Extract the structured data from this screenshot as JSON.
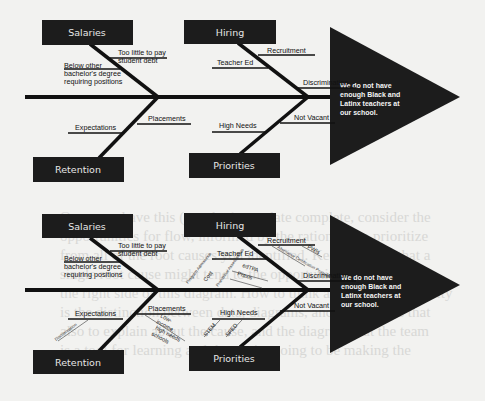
{
  "background_text": [
    "Once you have this (or other) template complete, consider the",
    "opportunities for flow, informed by the rationale, to prioritize",
    "from all of the root causes you identified. Keep in mind that a",
    "single root cause might tend to the opportunities at the heart",
    "the right side of this diagram. How to think about the opportunity",
    "is the distinction between data, diagrams, and the reasons that",
    "also to explain about the cause, and the diagram that the team",
    "is a tool for learning and that we're going to be making the"
  ],
  "diagrams": [
    {
      "id": "fishbone-basic",
      "effect": [
        "We do not have",
        "enough Black and",
        "Latinx teachers at",
        "our school."
      ],
      "categories": {
        "salaries": {
          "label": "Salaries",
          "causes": [
            {
              "label": "Too little to pay",
              "label2": "student debt"
            },
            {
              "label": "Below other",
              "label2": "bachelor's degree",
              "label3": "requiring positions"
            }
          ]
        },
        "hiring": {
          "label": "Hiring",
          "causes": [
            {
              "label": "Recruitment"
            },
            {
              "label": "Teacher Ed"
            },
            {
              "label": "Discrimination"
            }
          ]
        },
        "retention": {
          "label": "Retention",
          "causes": [
            {
              "label": "Placements"
            },
            {
              "label": "Expectations"
            }
          ]
        },
        "priorities": {
          "label": "Priorities",
          "causes": [
            {
              "label": "Not Vacant"
            },
            {
              "label": "High Needs"
            }
          ]
        }
      }
    },
    {
      "id": "fishbone-detailed",
      "effect": [
        "We do not have",
        "enough Black and",
        "Latinx teachers at",
        "our school."
      ],
      "categories": {
        "salaries": {
          "label": "Salaries",
          "causes": [
            {
              "label": "Too little to pay",
              "label2": "student debt"
            },
            {
              "label": "Below other",
              "label2": "bachelor's degree",
              "label3": "requiring positions"
            }
          ]
        },
        "hiring": {
          "label": "Hiring",
          "causes": [
            {
              "label": "Recruitment",
              "sub": [
                "Alternative Certification Programs",
                "PWIs"
              ]
            },
            {
              "label": "Teacher Ed",
              "sub": [
                "Program Admissions",
                "Cost",
                "Prohibitive Assessments",
                "edTPA",
                "Praxis"
              ]
            },
            {
              "label": "Discrimination"
            }
          ]
        },
        "retention": {
          "label": "Retention",
          "causes": [
            {
              "label": "Placements",
              "sub": [
                "Low-",
                "income,",
                "high needs",
                "schools"
              ]
            },
            {
              "label": "Expectations",
              "sub": [
                "Discrimination"
              ]
            }
          ]
        },
        "priorities": {
          "label": "Priorities",
          "causes": [
            {
              "label": "Not Vacant"
            },
            {
              "label": "High Needs",
              "sub": [
                "STEM",
                "SPED"
              ]
            }
          ]
        }
      }
    }
  ],
  "colors": {
    "box": "#1c1c1c",
    "line": "#111111",
    "page": "#f2f2f0",
    "effect_text": "#f4f4f4"
  }
}
